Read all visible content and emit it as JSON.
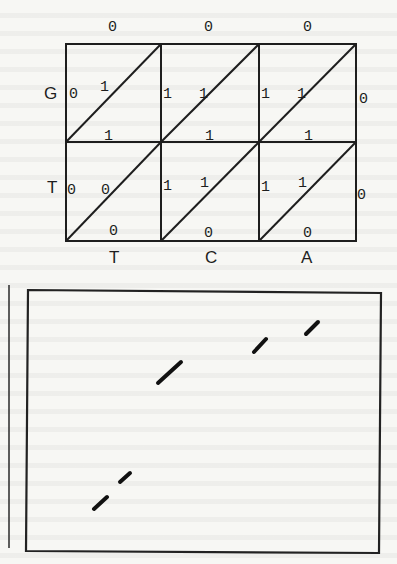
{
  "figure_top": {
    "title": "Sequence alignment grid",
    "row_labels": [
      "G",
      "T"
    ],
    "column_labels": [
      "T",
      "C",
      "A"
    ],
    "top_edge_weights": [
      "0",
      "0",
      "0"
    ],
    "cells": [
      [
        {
          "left": "0",
          "diag": "1",
          "bottom": "1"
        },
        {
          "left": "1",
          "diag": "1",
          "bottom": "1"
        },
        {
          "left": "1",
          "diag": "1",
          "bottom": "1",
          "right": "0"
        }
      ],
      [
        {
          "left": "0",
          "diag": "0",
          "bottom": "0"
        },
        {
          "left": "1",
          "diag": "1",
          "bottom": "0"
        },
        {
          "left": "1",
          "diag": "1",
          "bottom": "0",
          "right": "0"
        }
      ]
    ],
    "grid": {
      "x0": 66,
      "y0": 44,
      "col_w": 96,
      "row_h": 98,
      "cols": 3,
      "rows": 2
    },
    "stroke_color": "#1e1e1e"
  },
  "figure_bottom": {
    "description": "Dot plot box with diagonal segments",
    "box": {
      "x": 28,
      "y": 290,
      "w": 352,
      "h": 262
    },
    "margin_line": {
      "x": 9,
      "y1": 285,
      "y2": 548
    },
    "segments": [
      {
        "x1": 158,
        "y1": 383,
        "x2": 181,
        "y2": 362
      },
      {
        "x1": 254,
        "y1": 352,
        "x2": 266,
        "y2": 339
      },
      {
        "x1": 306,
        "y1": 334,
        "x2": 318,
        "y2": 322
      },
      {
        "x1": 120,
        "y1": 482,
        "x2": 130,
        "y2": 473
      },
      {
        "x1": 94,
        "y1": 509,
        "x2": 107,
        "y2": 497
      }
    ]
  }
}
